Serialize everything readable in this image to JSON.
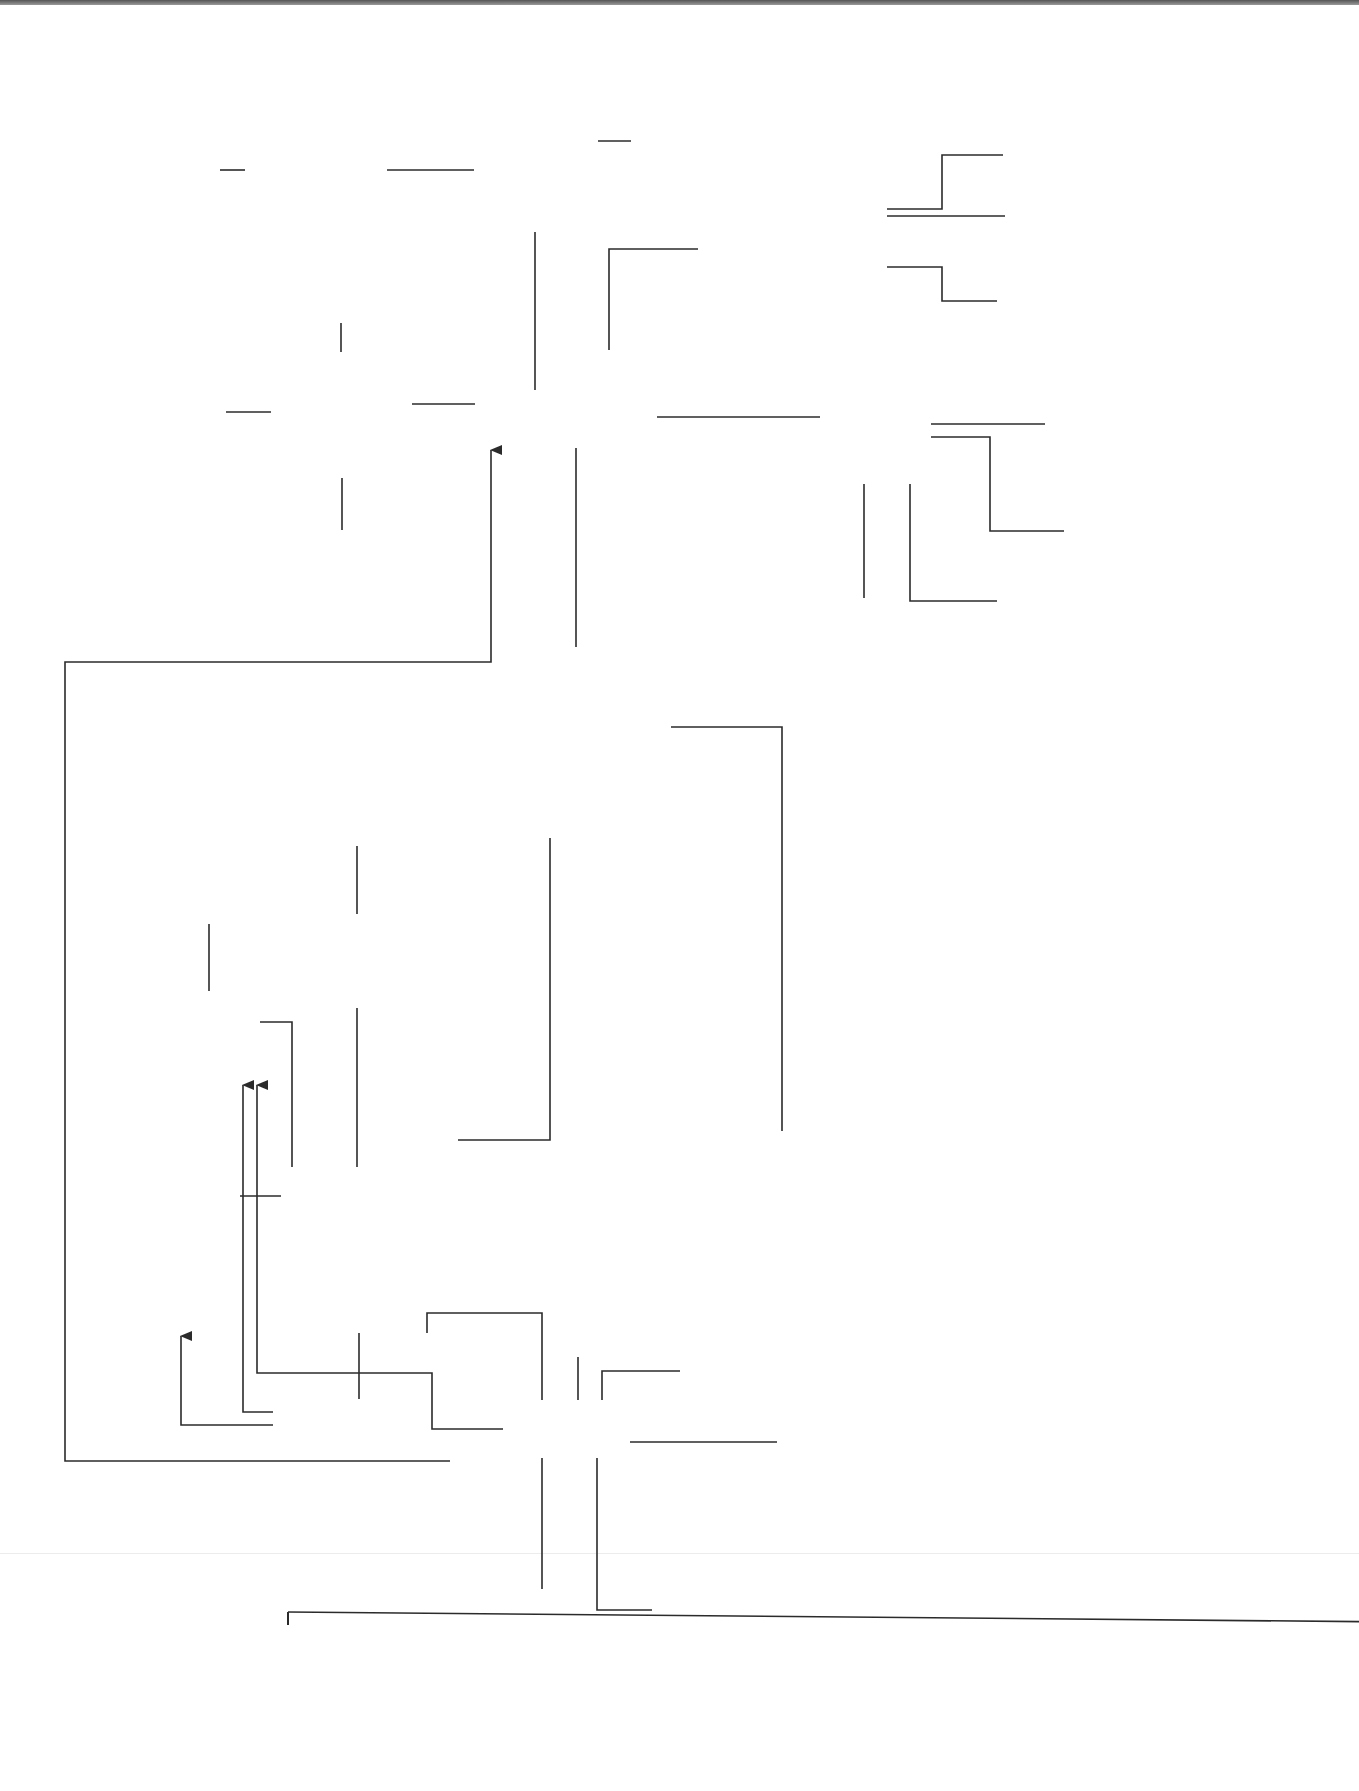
{
  "diagram": {
    "colors": {
      "line": "#2b2b2b",
      "node_fill": "#f7f7f7",
      "main_fill": "#ffffff",
      "module_fill": "#e6e6e6",
      "module_dark_fill": "#d3d3d3",
      "page_tab": "#5a5a5a"
    },
    "nodes": {
      "cells_top": "cells, tissues\nand organs\nModule 2",
      "lung_structure": "lung structure\nand function",
      "mammalian": "mammalian\ngaseous\nexchange\nsurfaces",
      "ventilating": "ventilating\nthe lungs",
      "measuring": "measuring\naspects of gaseous\nexchange",
      "data_logging": "data logging",
      "spirometers": "spirometers",
      "graphical": "graphical\nrepresentation\nof data",
      "organisation": "organisation\nof organisms",
      "need_for": "need for\nspecialised\nexchange\nsurfaces",
      "metabolic": "metabolic\nrate",
      "sav_top": "SA : V\nratio",
      "exchange_surfaces": "Exchange surfaces\nand breathing",
      "insects_fish": "insects\nand fish",
      "tracheal": "tracheal\nsystem",
      "gills": "gills",
      "countercurrent": "countercurrent\nexchange system",
      "classification": "classification\nModule 4",
      "exchange_transport": "Exchange\nand transport\nModule 3",
      "sav_animals": "SA : V\nratio",
      "cells_animals": "cells, tissues\nand organs\nModule 2",
      "transport_multi_animals": "transport in\nmulticellular\nanimals",
      "blood_vessels": "blood\nvessels",
      "biodiversity": "biodiversity\nand evolution",
      "adaptations": "adaptations\nto water\navailability",
      "sav_plants": "SA : V\nratio",
      "transport_multi_plants": "transport\nin multicellular\nplants",
      "cells_plants": "cells, tissues\nand organs\nModule 2",
      "water_transport": "water transport\nin multicellular\nplants",
      "transport_animals": "Transport\nin\nanimals",
      "blood_tissue": "blood, tissue\nfluid and lymph",
      "transport_plants": "Transport\nin\nplants",
      "dissection": "dissection",
      "transportation": "transportation",
      "potometer": "potometer",
      "pacemaker": "pacemaker\nregion",
      "translocation": "translocation",
      "calculating": "calculating\nrate of\nwater loss",
      "transport_o2": "transport\nof oxygen\nand carbon\ndioxide",
      "heart": "the heart",
      "measurements": "measurements\nof pressure/volume\ndata manipulation",
      "cellular_resp_left": "cellular\nrespiration\nModule 5",
      "muscle": "muscle\ncontraction\nModule 5",
      "nervous": "nervous\ncontrol\nModule 5",
      "photosynthesis": "photosynthesis\nModule 5",
      "cellular_resp_right": "cellular\nrespiration\nModule 5"
    }
  }
}
